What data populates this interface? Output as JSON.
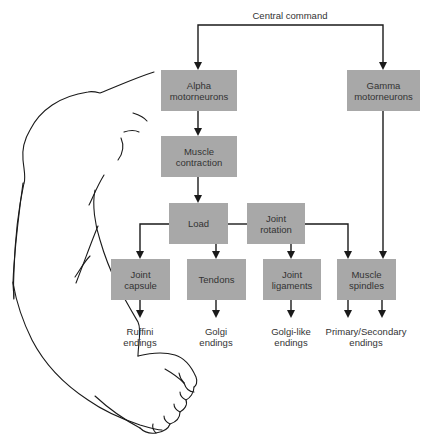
{
  "title": "Central command",
  "boxes": {
    "alpha": "Alpha\nmotorneurons",
    "gamma": "Gamma\nmotorneurons",
    "muscle_contraction": "Muscle\ncontraction",
    "load": "Load",
    "joint_rotation": "Joint\nrotation",
    "joint_capsule": "Joint\ncapsule",
    "tendons": "Tendons",
    "joint_ligaments": "Joint\nligaments",
    "muscle_spindles": "Muscle\nspindles"
  },
  "endings": {
    "ruffini": "Ruffini\nendings",
    "golgi": "Golgi\nendings",
    "golgi_like": "Golgi-like\nendings",
    "primary_secondary": "Primary/Secondary\nendings"
  },
  "colors": {
    "box_fill": "#a8a8a8",
    "line": "#1a1a1a",
    "text": "#333333"
  }
}
